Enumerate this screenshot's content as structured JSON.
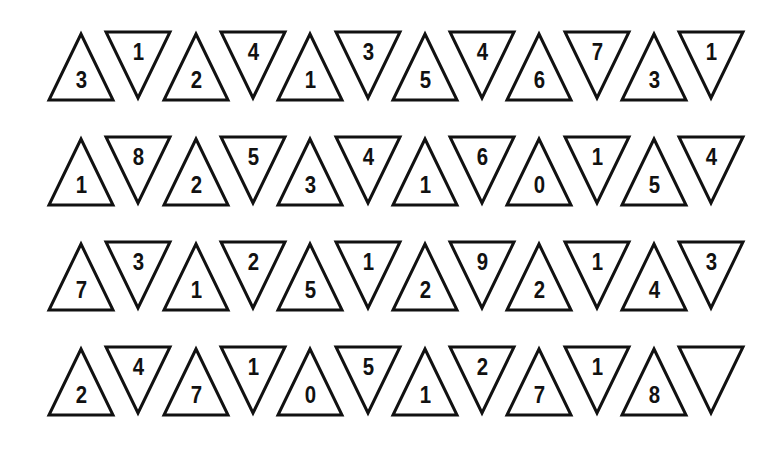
{
  "puzzle": {
    "stroke_color": "#111111",
    "background": "#ffffff",
    "rows": [
      {
        "cells": [
          {
            "dir": "up",
            "value": "3"
          },
          {
            "dir": "down",
            "value": "1"
          },
          {
            "dir": "up",
            "value": "2"
          },
          {
            "dir": "down",
            "value": "4"
          },
          {
            "dir": "up",
            "value": "1"
          },
          {
            "dir": "down",
            "value": "3"
          },
          {
            "dir": "up",
            "value": "5"
          },
          {
            "dir": "down",
            "value": "4"
          },
          {
            "dir": "up",
            "value": "6"
          },
          {
            "dir": "down",
            "value": "7"
          },
          {
            "dir": "up",
            "value": "3"
          },
          {
            "dir": "down",
            "value": "1"
          }
        ]
      },
      {
        "cells": [
          {
            "dir": "up",
            "value": "1"
          },
          {
            "dir": "down",
            "value": "8"
          },
          {
            "dir": "up",
            "value": "2"
          },
          {
            "dir": "down",
            "value": "5"
          },
          {
            "dir": "up",
            "value": "3"
          },
          {
            "dir": "down",
            "value": "4"
          },
          {
            "dir": "up",
            "value": "1"
          },
          {
            "dir": "down",
            "value": "6"
          },
          {
            "dir": "up",
            "value": "0"
          },
          {
            "dir": "down",
            "value": "1"
          },
          {
            "dir": "up",
            "value": "5"
          },
          {
            "dir": "down",
            "value": "4"
          }
        ]
      },
      {
        "cells": [
          {
            "dir": "up",
            "value": "7"
          },
          {
            "dir": "down",
            "value": "3"
          },
          {
            "dir": "up",
            "value": "1"
          },
          {
            "dir": "down",
            "value": "2"
          },
          {
            "dir": "up",
            "value": "5"
          },
          {
            "dir": "down",
            "value": "1"
          },
          {
            "dir": "up",
            "value": "2"
          },
          {
            "dir": "down",
            "value": "9"
          },
          {
            "dir": "up",
            "value": "2"
          },
          {
            "dir": "down",
            "value": "1"
          },
          {
            "dir": "up",
            "value": "4"
          },
          {
            "dir": "down",
            "value": "3"
          }
        ]
      },
      {
        "cells": [
          {
            "dir": "up",
            "value": "2"
          },
          {
            "dir": "down",
            "value": "4"
          },
          {
            "dir": "up",
            "value": "7"
          },
          {
            "dir": "down",
            "value": "1"
          },
          {
            "dir": "up",
            "value": "0"
          },
          {
            "dir": "down",
            "value": "5"
          },
          {
            "dir": "up",
            "value": "1"
          },
          {
            "dir": "down",
            "value": "2"
          },
          {
            "dir": "up",
            "value": "7"
          },
          {
            "dir": "down",
            "value": "1"
          },
          {
            "dir": "up",
            "value": "8"
          },
          {
            "dir": "down",
            "value": ""
          }
        ]
      }
    ]
  }
}
